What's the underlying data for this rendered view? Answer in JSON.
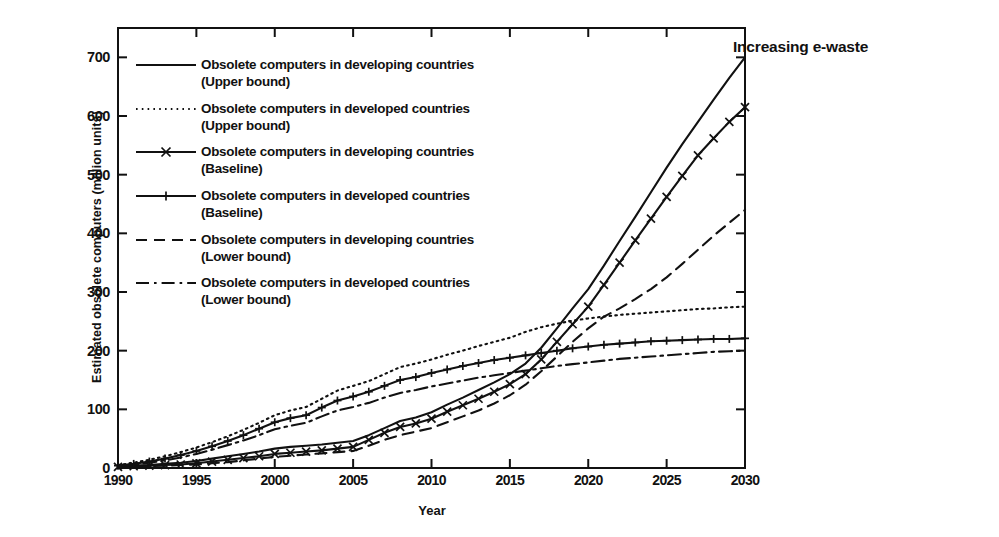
{
  "title": "Increasing e-waste",
  "axes": {
    "xlabel": "Year",
    "ylabel": "Estimated obsolete computers (million units)",
    "xticks": [
      "1990",
      "1995",
      "2000",
      "2005",
      "2010",
      "2015",
      "2020",
      "2025",
      "2030"
    ],
    "yticks": [
      "0",
      "100",
      "200",
      "300",
      "400",
      "500",
      "600",
      "700"
    ]
  },
  "legend": {
    "items": [
      {
        "line1": "Obsolete computers in developing countries",
        "line2": "(Upper bound)",
        "style": "solid"
      },
      {
        "line1": "Obsolete computers in developed countries",
        "line2": "(Upper bound)",
        "style": "dotted"
      },
      {
        "line1": "Obsolete computers in developing countries",
        "line2": "(Baseline)",
        "style": "solid-cross"
      },
      {
        "line1": "Obsolete computers in developed countries",
        "line2": "(Baseline)",
        "style": "solid-plus"
      },
      {
        "line1": "Obsolete computers in developing countries",
        "line2": "(Lower bound)",
        "style": "dashed"
      },
      {
        "line1": "Obsolete computers in developed countries",
        "line2": "(Lower bound)",
        "style": "dashdot"
      }
    ]
  },
  "chart_data": {
    "type": "line",
    "title": "Increasing e-waste",
    "xlabel": "Year",
    "ylabel": "Estimated obsolete computers (million units)",
    "xlim": [
      1990,
      2030
    ],
    "ylim": [
      0,
      750
    ],
    "grid": false,
    "legend_position": "inside-upper-left",
    "x": [
      1990,
      1991,
      1992,
      1993,
      1994,
      1995,
      1996,
      1997,
      1998,
      1999,
      2000,
      2001,
      2002,
      2003,
      2004,
      2005,
      2006,
      2007,
      2008,
      2009,
      2010,
      2011,
      2012,
      2013,
      2014,
      2015,
      2016,
      2017,
      2018,
      2019,
      2020,
      2021,
      2022,
      2023,
      2024,
      2025,
      2026,
      2027,
      2028,
      2029,
      2030
    ],
    "series": [
      {
        "name": "Obsolete computers in developing countries (Upper bound)",
        "style": "solid",
        "marker": "none",
        "values": [
          3,
          4,
          5,
          7,
          9,
          12,
          16,
          20,
          24,
          28,
          33,
          36,
          38,
          40,
          43,
          46,
          56,
          68,
          80,
          86,
          95,
          108,
          120,
          133,
          146,
          160,
          178,
          205,
          238,
          272,
          305,
          345,
          387,
          428,
          470,
          512,
          552,
          590,
          628,
          665,
          700
        ]
      },
      {
        "name": "Obsolete computers in developed countries (Upper bound)",
        "style": "dotted",
        "marker": "none",
        "values": [
          5,
          9,
          14,
          20,
          27,
          35,
          44,
          54,
          65,
          77,
          90,
          98,
          104,
          118,
          132,
          140,
          148,
          160,
          172,
          178,
          185,
          193,
          200,
          208,
          215,
          222,
          232,
          240,
          246,
          251,
          255,
          258,
          261,
          263,
          265,
          267,
          269,
          271,
          272,
          274,
          275
        ]
      },
      {
        "name": "Obsolete computers in developing countries (Baseline)",
        "style": "solid",
        "marker": "cross",
        "values": [
          2,
          3,
          4,
          5,
          6,
          8,
          11,
          14,
          17,
          20,
          24,
          26,
          28,
          30,
          33,
          36,
          48,
          60,
          70,
          76,
          84,
          96,
          107,
          118,
          130,
          143,
          160,
          185,
          215,
          245,
          275,
          312,
          350,
          388,
          425,
          462,
          498,
          533,
          562,
          590,
          615
        ]
      },
      {
        "name": "Obsolete computers in developed countries (Baseline)",
        "style": "solid",
        "marker": "plus",
        "values": [
          4,
          7,
          11,
          16,
          22,
          29,
          37,
          46,
          56,
          67,
          78,
          85,
          90,
          103,
          115,
          122,
          130,
          140,
          150,
          155,
          162,
          168,
          174,
          179,
          184,
          188,
          192,
          196,
          200,
          204,
          207,
          210,
          212,
          214,
          216,
          217,
          218,
          219,
          220,
          220,
          221
        ]
      },
      {
        "name": "Obsolete computers in developing countries (Lower bound)",
        "style": "dashed",
        "marker": "none",
        "values": [
          1,
          2,
          3,
          4,
          5,
          6,
          8,
          10,
          13,
          16,
          19,
          21,
          23,
          25,
          27,
          29,
          38,
          48,
          56,
          62,
          68,
          78,
          88,
          98,
          110,
          124,
          142,
          165,
          190,
          215,
          238,
          258,
          272,
          288,
          305,
          325,
          348,
          372,
          396,
          418,
          440
        ]
      },
      {
        "name": "Obsolete computers in developed countries (Lower bound)",
        "style": "dashdot",
        "marker": "none",
        "values": [
          3,
          6,
          9,
          13,
          18,
          24,
          31,
          39,
          47,
          56,
          66,
          72,
          77,
          88,
          98,
          104,
          111,
          120,
          128,
          133,
          139,
          144,
          149,
          154,
          158,
          162,
          166,
          170,
          174,
          177,
          180,
          183,
          186,
          188,
          190,
          192,
          194,
          196,
          198,
          199,
          200
        ]
      }
    ]
  }
}
